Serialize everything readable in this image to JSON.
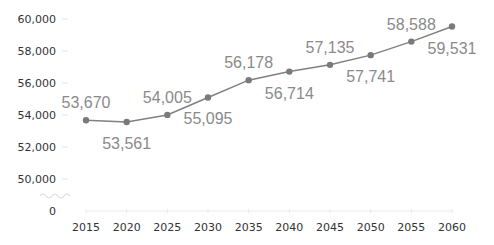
{
  "chart_data": {
    "type": "line",
    "title": "",
    "xlabel": "",
    "ylabel": "",
    "categories": [
      "2015",
      "2020",
      "2025",
      "2030",
      "2035",
      "2040",
      "2045",
      "2050",
      "2055",
      "2060"
    ],
    "series": [
      {
        "name": "",
        "values": [
          53670,
          53561,
          54005,
          55095,
          56178,
          56714,
          57135,
          57741,
          58588,
          59531
        ],
        "labels": [
          "53,670",
          "53,561",
          "54,005",
          "55,095",
          "56,178",
          "56,714",
          "57,135",
          "57,741",
          "58,588",
          "59,531"
        ],
        "label_positions": [
          "above",
          "below",
          "above",
          "below",
          "above",
          "below",
          "above",
          "below",
          "above",
          "below"
        ]
      }
    ],
    "yticks": [
      "0",
      "50,000",
      "52,000",
      "54,000",
      "56,000",
      "58,000",
      "60,000"
    ],
    "ylim": [
      50000,
      60000
    ],
    "axis_break": true,
    "grid": false,
    "legend": "none",
    "colors": {
      "line": "#808080",
      "marker": "#7a7a7a",
      "data_label": "#8a8a8a",
      "tick_label": "#333333"
    }
  }
}
